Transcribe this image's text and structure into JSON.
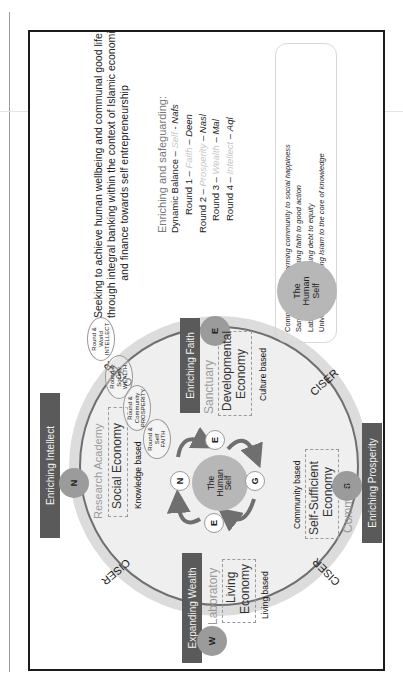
{
  "heading": {
    "lines": [
      "Seeking to achieve human wellbeing and communal good life",
      "through integral banking within the context of Islamic economics",
      "and finance towards self entrepreneurship"
    ]
  },
  "enriching": {
    "title": "Enriching and safeguarding:",
    "rows": [
      {
        "prefix": "Dynamic Balance – ",
        "faint": "Self",
        "sep": " - ",
        "term": "Nafs"
      },
      {
        "prefix": "Round 1 – ",
        "faint": "Faith",
        "sep": " – ",
        "term": "Deen"
      },
      {
        "prefix": "Round 2 – ",
        "faint": "Prosperity",
        "sep": " – ",
        "term": "Nasl"
      },
      {
        "prefix": "Round 3 – ",
        "faint": "Wealth",
        "sep": " – ",
        "term": "Mal"
      },
      {
        "prefix": "Round 4 – ",
        "faint": "Intellect",
        "sep": " – ",
        "term": "Aql"
      }
    ]
  },
  "legend": {
    "items": [
      {
        "label": "Community",
        "desc": "Transforming community to social happiness"
      },
      {
        "label": "Sanctuary",
        "desc": "Transforming faith to good action"
      },
      {
        "label": "Laboratory",
        "desc": "Transforming debt to equity"
      },
      {
        "label": "University",
        "desc": "Tranforming Islam to the core of knowledge"
      }
    ],
    "self_circle": {
      "line1": "The",
      "line2": "Human",
      "line3": "Self"
    }
  },
  "wheel": {
    "ciser_label": "CISER",
    "bars": {
      "intellect": "Enriching Intellect",
      "faith": "Enriching Faith",
      "prosperity": "Enriching Prosperity",
      "wealth": "Expanding Wealth"
    },
    "badges": {
      "intellect": "N",
      "faith": "E",
      "prosperity": "S",
      "wealth": "W"
    },
    "quadrants": {
      "intellect": {
        "place": "Research Academy",
        "economy": "Social Economy",
        "basis": "Knowledge based"
      },
      "faith": {
        "place": "Sanctuary",
        "economy_1": "Developmental",
        "economy_2": "Economy",
        "basis": "Culture based"
      },
      "prosperity": {
        "place": "Community",
        "economy_1": "Self-Sufficient",
        "economy_2": "Economy",
        "basis": "Community based"
      },
      "wealth": {
        "place": "Laboratory",
        "economy_1": "Living",
        "economy_2": "Economy",
        "basis": "Living based"
      }
    },
    "center": {
      "line1": "The",
      "line2": "Human",
      "line3": "Self",
      "nodes": {
        "top": "E",
        "left": "N",
        "right": "G",
        "bottom": "E"
      }
    },
    "rounds": [
      {
        "l1": "Round &",
        "l2": "World",
        "l3": "INTELLECT"
      },
      {
        "l1": "Round &",
        "l2": "Society",
        "l3": "WEALTH"
      },
      {
        "l1": "Round &",
        "l2": "Community",
        "l3": "PROSPERITY"
      },
      {
        "l1": "Round &",
        "l2": "Self",
        "l3": "FAITH"
      }
    ]
  },
  "colors": {
    "bar": "#5a5a5a",
    "badge": "#9b9b9b",
    "ring_outer": "#dcdcdc",
    "ring_inner": "#efefef",
    "arc": "#6f6f6f",
    "self": "#b7b7b7",
    "border": "#1b1b1b"
  }
}
